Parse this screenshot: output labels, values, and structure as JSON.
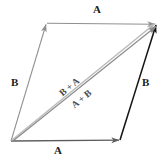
{
  "diagram": {
    "labels": {
      "top_edge": "A",
      "bottom_edge": "A",
      "left_edge": "B",
      "right_edge": "B",
      "diagonal_upper": "B + A",
      "diagonal_lower": "A + B"
    },
    "colors": {
      "background": "#ffffff",
      "edge_light_gray": "#8f8f8f",
      "edge_mid_gray": "#6e6e6e",
      "edge_dark": "#1a1a1a",
      "diagonal_light": "#b0b0b0",
      "diagonal_gray": "#8a8a8a",
      "label_text": "#1c1c1c",
      "diagonal_label_text": "#4a4a4a"
    },
    "geometry": {
      "origin": [
        11,
        141
      ],
      "bottom_right": [
        120,
        140
      ],
      "top_right": [
        157,
        24
      ],
      "top_left": [
        47,
        23
      ]
    },
    "label_positions": {
      "top_edge": [
        96,
        10
      ],
      "bottom_edge": [
        57,
        151
      ],
      "left_edge": [
        14,
        83
      ],
      "right_edge": [
        145,
        83
      ],
      "diagonal_upper": [
        61,
        86
      ],
      "diagonal_lower": [
        74,
        97
      ]
    },
    "vectors": [
      {
        "name": "A-top",
        "from": "top_left",
        "to": "top_right",
        "label": "A",
        "color": "#8f8f8f"
      },
      {
        "name": "A-bottom",
        "from": "origin",
        "to": "bottom_right",
        "label": "A",
        "color": "#6e6e6e"
      },
      {
        "name": "B-left",
        "from": "origin",
        "to": "top_left",
        "label": "B",
        "color": "#8f8f8f"
      },
      {
        "name": "B-right",
        "from": "bottom_right",
        "to": "top_right",
        "label": "B",
        "color": "#1a1a1a"
      },
      {
        "name": "resultant-upper",
        "from": "origin",
        "to": "top_right",
        "label": "B + A",
        "color": "#b0b0b0"
      },
      {
        "name": "resultant-lower",
        "from": "origin",
        "to": "top_right",
        "label": "A + B",
        "color": "#8a8a8a"
      }
    ]
  }
}
